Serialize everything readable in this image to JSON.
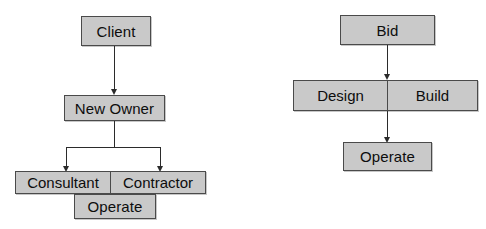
{
  "diagram": {
    "background_color": "#ffffff",
    "node_fill_color": "#c9c9c9",
    "node_border_color": "#4a4a4a",
    "connector_color": "#2b2b2b",
    "panels": [
      {
        "id": "left-panel",
        "name": "new-owner-route",
        "nodes": {
          "client": "Client",
          "new_owner": "New Owner",
          "consultant": "Consultant",
          "contractor": "Contractor",
          "operate": "Operate"
        }
      },
      {
        "id": "right-panel",
        "name": "design-build-route",
        "nodes": {
          "bid": "Bid",
          "design": "Design",
          "build": "Build",
          "operate": "Operate"
        }
      }
    ]
  }
}
